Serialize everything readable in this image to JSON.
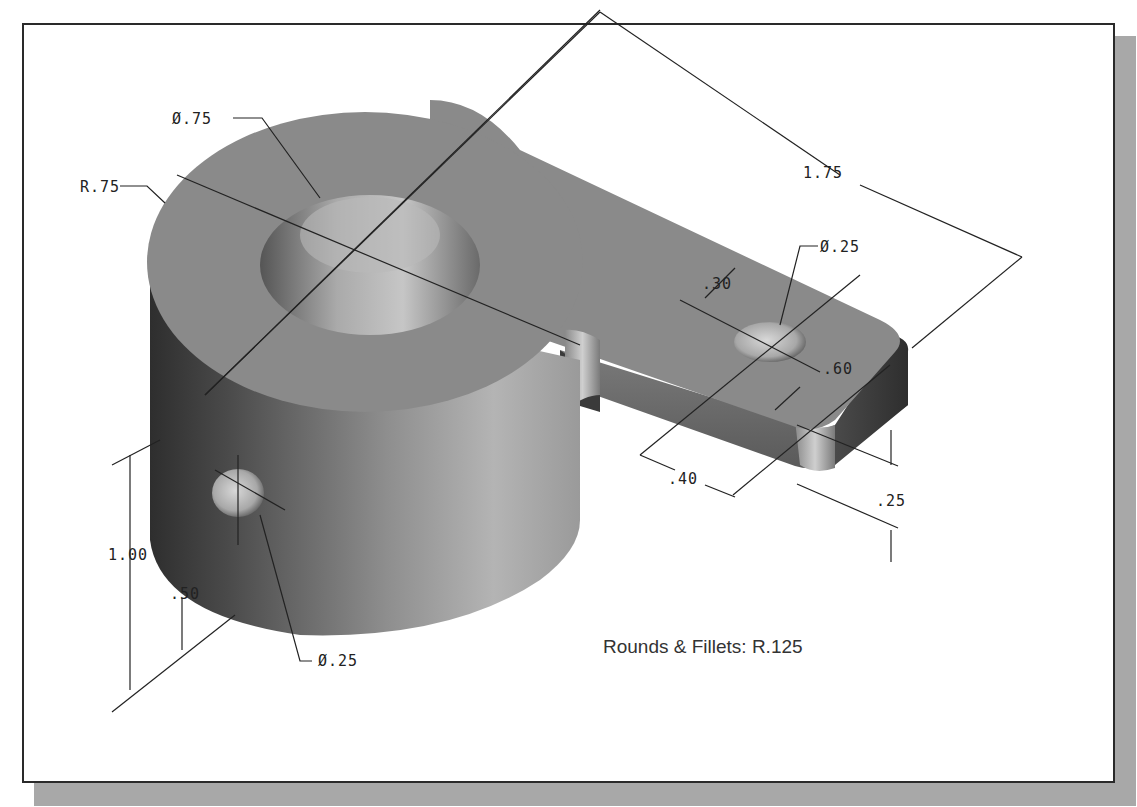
{
  "figure": {
    "type": "isometric-engineering-drawing",
    "note": "Rounds & Fillets: R.125",
    "colors": {
      "frame_border": "#2a2a2a",
      "shadow": "#a8a8a8",
      "solid_top": "#8a8a8a",
      "solid_side_dark": "#3a3a3a",
      "solid_side_light": "#b0b0b0",
      "bore_highlight": "#c8c8c8",
      "dimension_line": "#222222"
    }
  },
  "dimensions": {
    "bore_diameter": "Ø.75",
    "outer_radius": "R.75",
    "arm_length": "1.75",
    "arm_hole_diameter": "Ø.25",
    "arm_hole_offset": ".30",
    "arm_width": ".60",
    "arm_hole_to_end": ".40",
    "arm_thickness": ".25",
    "cylinder_height": "1.00",
    "side_hole_height": ".50",
    "side_hole_diameter": "Ø.25"
  }
}
